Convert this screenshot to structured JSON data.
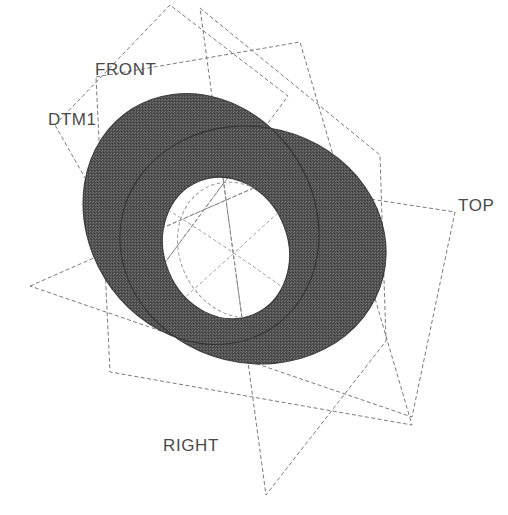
{
  "view": {
    "title": "Pro/ENGINEER datum plane model view",
    "background_color": "#ffffff",
    "line_color": "#787878",
    "label_color": "#4a4a4a",
    "solid_fill_color": "#5a5a5a",
    "solid_edge_color": "#3c3c3c",
    "width": 508,
    "height": 515
  },
  "labels": {
    "front": "FRONT",
    "dtm1": "DTM1",
    "top": "TOP",
    "right": "RIGHT"
  },
  "datum_planes": [
    {
      "name": "FRONT",
      "label": "FRONT",
      "label_x": 95,
      "label_y": 61,
      "corners": [
        [
          96,
          77
        ],
        [
          300,
          42
        ],
        [
          412,
          425
        ],
        [
          110,
          372
        ]
      ]
    },
    {
      "name": "DTM1",
      "label": "DTM1",
      "label_x": 48,
      "label_y": 111,
      "corners": [
        [
          55,
          125
        ],
        [
          170,
          5
        ],
        [
          288,
          96
        ],
        [
          147,
          287
        ]
      ]
    },
    {
      "name": "TOP",
      "label": "TOP",
      "label_x": 458,
      "label_y": 197,
      "corners": [
        [
          30,
          286
        ],
        [
          265,
          183
        ],
        [
          455,
          212
        ],
        [
          412,
          417
        ]
      ]
    },
    {
      "name": "RIGHT",
      "label": "RIGHT",
      "label_x": 163,
      "label_y": 437,
      "corners": [
        [
          200,
          8
        ],
        [
          380,
          155
        ],
        [
          386,
          341
        ],
        [
          266,
          495
        ]
      ]
    }
  ],
  "solid": {
    "type": "two-overlapping-discs-with-through-hole",
    "discs": [
      {
        "name": "upper-left-disc",
        "cx": 201,
        "cy": 219,
        "rx": 113,
        "ry": 130,
        "rotation_deg": -32
      },
      {
        "name": "lower-right-disc",
        "cx": 253,
        "cy": 245,
        "rx": 134,
        "ry": 118,
        "rotation_deg": 14
      }
    ],
    "hole": {
      "name": "central-through-hole",
      "cx": 226,
      "cy": 248,
      "rx": 62,
      "ry": 72,
      "rotation_deg": -22
    },
    "hidden_edges": [
      {
        "name": "hole-back-edge-ellipse",
        "cx": 238,
        "cy": 250,
        "rx": 58,
        "ry": 70,
        "rotation_deg": -26
      }
    ]
  },
  "chart_data": {
    "type": "table",
    "columns": [
      "plane",
      "c1",
      "c2",
      "c3",
      "c4"
    ],
    "rows": [
      [
        "FRONT",
        "96,77",
        "300,42",
        "412,425",
        "110,372"
      ],
      [
        "DTM1",
        "55,125",
        "170,5",
        "288,96",
        "147,287"
      ],
      [
        "TOP",
        "30,286",
        "265,183",
        "455,212",
        "412,417"
      ],
      [
        "RIGHT",
        "200,8",
        "380,155",
        "386,341",
        "266,495"
      ]
    ]
  }
}
